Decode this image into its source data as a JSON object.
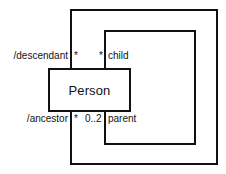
{
  "diagram": {
    "type": "uml-class-diagram",
    "background_color": "#ffffff",
    "line_color": "#111111",
    "classes": [
      {
        "name": "Person",
        "x": 48,
        "y": 68,
        "width": 83,
        "height": 44
      }
    ],
    "associations": [
      {
        "id": "outer-association-path",
        "description": "derived ancestor/descendant association path",
        "x": 70,
        "y": 9,
        "width": 148,
        "height": 156,
        "ends": [
          {
            "role": "/descendant",
            "multiplicity": "*"
          },
          {
            "role": "/ancestor",
            "multiplicity": "*"
          }
        ]
      },
      {
        "id": "inner-association-path",
        "description": "child/parent association path",
        "x": 104,
        "y": 30,
        "width": 92,
        "height": 115,
        "ends": [
          {
            "role": "child",
            "multiplicity": "*"
          },
          {
            "role": "parent",
            "multiplicity": "0..2"
          }
        ]
      }
    ],
    "labels": {
      "descendant_role": "/descendant",
      "descendant_multiplicity": "*",
      "child_multiplicity": "*",
      "child_role": "child",
      "ancestor_role": "/ancestor",
      "ancestor_multiplicity": "*",
      "parent_multiplicity": "0..2",
      "parent_role": "parent"
    }
  }
}
